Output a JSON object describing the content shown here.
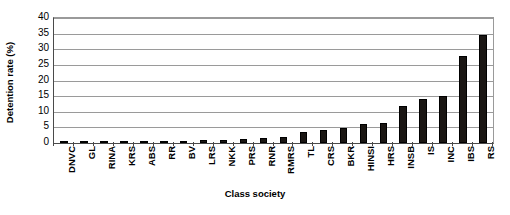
{
  "chart_data": {
    "type": "bar",
    "title": "",
    "xlabel": "Class society",
    "ylabel": "Detention rate (%)",
    "ylim": [
      0,
      40
    ],
    "ytick_step": 5,
    "ytick_labels": [
      "40",
      "35",
      "30",
      "25",
      "20",
      "15",
      "10",
      "5",
      "0"
    ],
    "ytick_values": [
      40,
      35,
      30,
      25,
      20,
      15,
      10,
      5,
      0
    ],
    "grid": true,
    "legend": "none",
    "bar_color": "#1a1613",
    "background_color": "#ffffff",
    "axis_color": "#4a4a4a",
    "gridline_color": "#9a9a9a",
    "categories": [
      "DNVC",
      "GL",
      "RINA",
      "KRS",
      "ABS",
      "RR",
      "BV",
      "LRS",
      "NKK",
      "PRS",
      "RNR",
      "RMRS",
      "TL",
      "CRS",
      "BKR",
      "HINSI",
      "HRS",
      "INSB",
      "IS",
      "INC",
      "IBS",
      "RS"
    ],
    "values": [
      0.3,
      0.4,
      0.4,
      0.5,
      0.5,
      0.7,
      0.8,
      0.9,
      1.0,
      1.2,
      1.6,
      2.0,
      3.5,
      4.2,
      4.8,
      6.2,
      6.3,
      12.0,
      14.2,
      15.1,
      28.0,
      34.5
    ],
    "series": [
      {
        "name": "Detention rate",
        "values": [
          0.3,
          0.4,
          0.4,
          0.5,
          0.5,
          0.7,
          0.8,
          0.9,
          1.0,
          1.2,
          1.6,
          2.0,
          3.5,
          4.2,
          4.8,
          6.2,
          6.3,
          12.0,
          14.2,
          15.1,
          28.0,
          34.5
        ]
      }
    ]
  }
}
